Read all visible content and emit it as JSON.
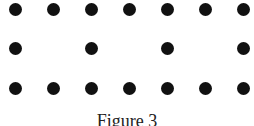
{
  "figure": {
    "caption": "Figure 3",
    "dot_color": "#111111",
    "columns_x": [
      15,
      53,
      91,
      129,
      167,
      205,
      243
    ],
    "rows": [
      {
        "y": 9,
        "cols": [
          0,
          1,
          2,
          3,
          4,
          5,
          6
        ]
      },
      {
        "y": 48,
        "cols": [
          0,
          2,
          4,
          6
        ]
      },
      {
        "y": 88,
        "cols": [
          0,
          1,
          2,
          3,
          4,
          5,
          6
        ]
      }
    ],
    "dot_count": 18
  }
}
